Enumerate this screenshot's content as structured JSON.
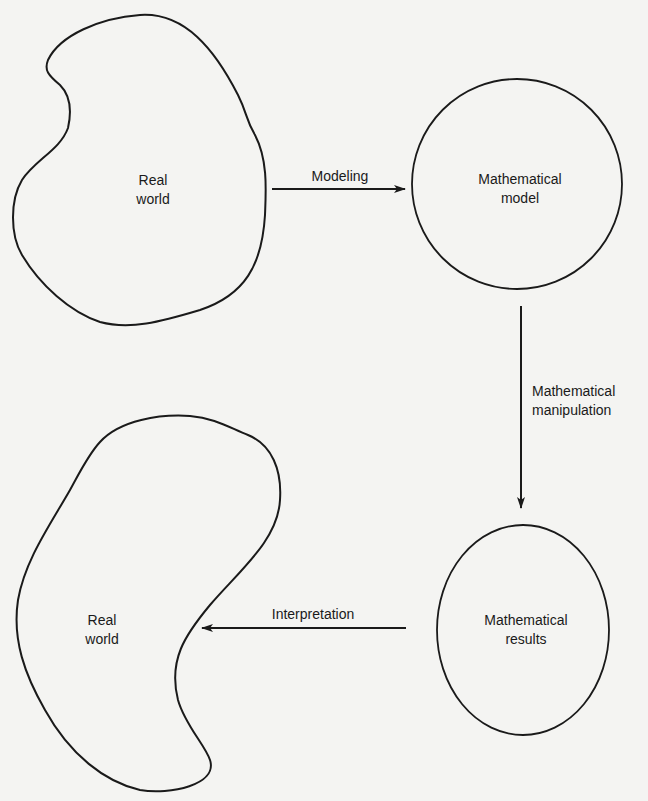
{
  "diagram": {
    "nodes": {
      "real_world_top": {
        "line1": "Real",
        "line2": "world"
      },
      "math_model": {
        "line1": "Mathematical",
        "line2": "model"
      },
      "math_results": {
        "line1": "Mathematical",
        "line2": "results"
      },
      "real_world_bottom": {
        "line1": "Real",
        "line2": "world"
      }
    },
    "edges": {
      "modeling": {
        "label": "Modeling"
      },
      "manipulation": {
        "line1": "Mathematical",
        "line2": "manipulation"
      },
      "interpretation": {
        "label": "Interpretation"
      }
    },
    "colors": {
      "stroke": "#1a1a1a",
      "background": "#f4f4f2"
    }
  }
}
